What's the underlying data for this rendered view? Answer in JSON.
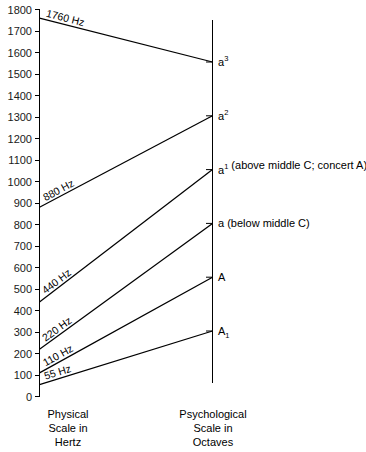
{
  "figure": {
    "left_axis_caption": [
      "Physical",
      "Scale in",
      "Hertz"
    ],
    "right_axis_caption": [
      "Psychological",
      "Scale in",
      "Octaves"
    ]
  },
  "chart_data": {
    "type": "line",
    "title": "",
    "xlabel": "",
    "ylabel": "",
    "left_axis": {
      "label_lines": [
        "Physical",
        "Scale in",
        "Hertz"
      ],
      "unit": "Hertz",
      "ylim": [
        0,
        1800
      ],
      "tick_step": 100,
      "tick_labels": [
        "1800",
        "1700",
        "1600",
        "1500",
        "1400",
        "1300",
        "1200",
        "1100",
        "1000",
        "900",
        "800",
        "700",
        "600",
        "500",
        "400",
        "300",
        "200",
        "100",
        "0"
      ],
      "tick_values": [
        1800,
        1700,
        1600,
        1500,
        1400,
        1300,
        1200,
        1100,
        1000,
        900,
        800,
        700,
        600,
        500,
        400,
        300,
        200,
        100,
        0
      ],
      "grid": false
    },
    "right_axis": {
      "label_lines": [
        "Psychological",
        "Scale in",
        "Octaves"
      ],
      "unit": "Octaves",
      "grid": false,
      "notes": [
        {
          "base": "a",
          "script": "3",
          "script_type": "superscript",
          "annotation": "",
          "full_label": "a3"
        },
        {
          "base": "a",
          "script": "2",
          "script_type": "superscript",
          "annotation": "",
          "full_label": "a2"
        },
        {
          "base": "a",
          "script": "1",
          "script_type": "superscript",
          "annotation": "(above middle C; concert A)",
          "full_label": "a1 (above middle C; concert A)"
        },
        {
          "base": "a",
          "script": "",
          "script_type": "none",
          "annotation": "(below middle C)",
          "full_label": "a (below middle C)"
        },
        {
          "base": "A",
          "script": "",
          "script_type": "none",
          "annotation": "",
          "full_label": "A"
        },
        {
          "base": "A",
          "script": "1",
          "script_type": "subscript",
          "annotation": "",
          "full_label": "A1"
        }
      ]
    },
    "series": [
      {
        "name": "1760 Hz",
        "hz": 1760,
        "note": "a3",
        "octave_index": 5,
        "label": "1760 Hz"
      },
      {
        "name": "880 Hz",
        "hz": 880,
        "note": "a2",
        "octave_index": 4,
        "label": "880 Hz"
      },
      {
        "name": "440 Hz",
        "hz": 440,
        "note": "a1",
        "octave_index": 3,
        "label": "440 Hz"
      },
      {
        "name": "220 Hz",
        "hz": 220,
        "note": "a",
        "octave_index": 2,
        "label": "220 Hz"
      },
      {
        "name": "110 Hz",
        "hz": 110,
        "note": "A",
        "octave_index": 1,
        "label": "110 Hz"
      },
      {
        "name": "55 Hz",
        "hz": 55,
        "note": "A1",
        "octave_index": 0,
        "label": "55 Hz"
      }
    ],
    "colors": {
      "line": "#000000",
      "axis": "#000000",
      "text": "#000000",
      "background": "#ffffff"
    }
  }
}
